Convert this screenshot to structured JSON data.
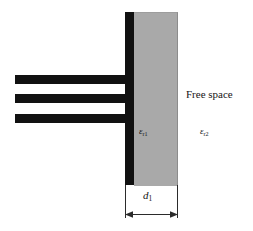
{
  "figure": {
    "width": 253,
    "height": 231,
    "background": "#ffffff"
  },
  "labels": {
    "free_space": "Free space",
    "epsilon_r1_symbol": "ε",
    "epsilon_r1_subscript": "r1",
    "epsilon_r2_symbol": "ε",
    "epsilon_r2_subscript": "r2",
    "thickness_symbol": "d",
    "thickness_subscript": "1"
  },
  "regions": [
    {
      "name": "dielectric-slab",
      "fill": "#a9a9a9",
      "permittivity_label": "εr1",
      "thickness_label": "d1",
      "x": 134,
      "y": 12,
      "width": 43,
      "height": 173
    },
    {
      "name": "free-space-region",
      "fill": "#ffffff",
      "permittivity_label": "εr2",
      "text_label": "Free space"
    }
  ],
  "conductors": {
    "color": "#111111",
    "vertical_bar": {
      "x": 125,
      "width": 9,
      "top": 12,
      "bottom": 185
    },
    "strips": [
      {
        "name": "conductor-strip-1",
        "x": 15,
        "y": 75,
        "width": 119,
        "height": 9
      },
      {
        "name": "conductor-strip-2",
        "x": 15,
        "y": 94,
        "width": 119,
        "height": 9
      },
      {
        "name": "conductor-strip-3",
        "x": 15,
        "y": 114,
        "width": 119,
        "height": 9
      }
    ]
  },
  "dimension": {
    "name": "slab-thickness-dimension",
    "label": "d1",
    "line_color": "#2b2b2b",
    "start_x": 125,
    "end_x": 177,
    "y": 214
  },
  "colors": {
    "conductor": "#111111",
    "dielectric": "#a9a9a9",
    "free_space": "#ffffff",
    "line": "#2b2b2b",
    "text": "#151515"
  }
}
